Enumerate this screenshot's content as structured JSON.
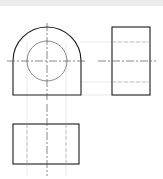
{
  "drawing": {
    "type": "orthographic-projection",
    "views": [
      {
        "name": "front-view",
        "shape": "arched block with through hole"
      },
      {
        "name": "side-view",
        "shape": "rectangle with hidden hole lines"
      },
      {
        "name": "top-view",
        "shape": "rectangle with hidden hole lines"
      }
    ],
    "colors": {
      "outline": "#1a1a1a",
      "hidden": "#b0b0b0",
      "center": "#555555",
      "projection": "#d8d8d8",
      "circle": "#8a8a8a",
      "strip": "#ebebeb"
    }
  }
}
